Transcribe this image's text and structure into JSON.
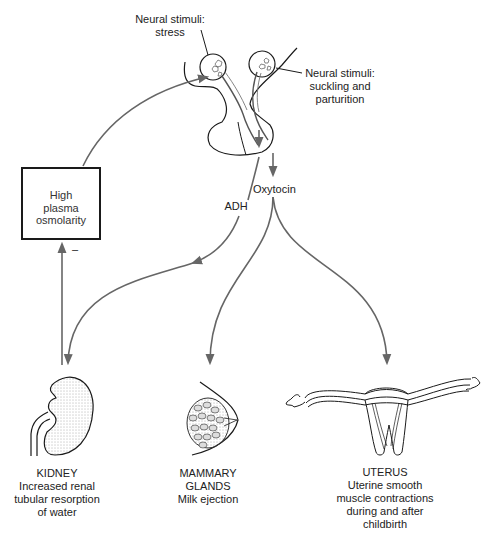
{
  "colors": {
    "arrow": "#666666",
    "line": "#1a1a1a",
    "background": "#ffffff"
  },
  "stimuli": {
    "stress": [
      "Neural stimuli:",
      "stress"
    ],
    "suckling": [
      "Neural stimuli:",
      "suckling and",
      "parturition"
    ]
  },
  "hormones": {
    "adh": "ADH",
    "oxytocin": "Oxytocin"
  },
  "feedback_box": {
    "lines": [
      "High",
      "plasma",
      "osmolarity"
    ],
    "sign": "–"
  },
  "targets": [
    {
      "id": "kidney",
      "lines": [
        "KIDNEY",
        "Increased renal",
        "tubular resorption",
        "of water"
      ]
    },
    {
      "id": "mammary",
      "lines": [
        "MAMMARY",
        "GLANDS",
        "Milk ejection"
      ]
    },
    {
      "id": "uterus",
      "lines": [
        "UTERUS",
        "Uterine smooth",
        "muscle contractions",
        "during and after",
        "childbirth"
      ]
    }
  ]
}
